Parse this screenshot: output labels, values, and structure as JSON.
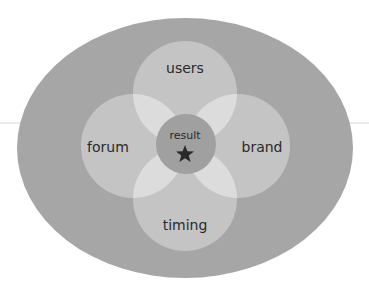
{
  "diagram": {
    "type": "venn-flower",
    "colors": {
      "background": "#ffffff",
      "outer_ellipse": "#a6a6a6",
      "petal": "#c4c4c4",
      "overlap": "#dcdcdc",
      "center": "#a0a0a0",
      "text": "#2a2a2a",
      "rule_line": "#cfcfcf"
    },
    "petals": [
      {
        "label": "users"
      },
      {
        "label": "forum"
      },
      {
        "label": "brand"
      },
      {
        "label": "timing"
      }
    ],
    "center": {
      "label": "result",
      "icon": "star-icon"
    }
  }
}
